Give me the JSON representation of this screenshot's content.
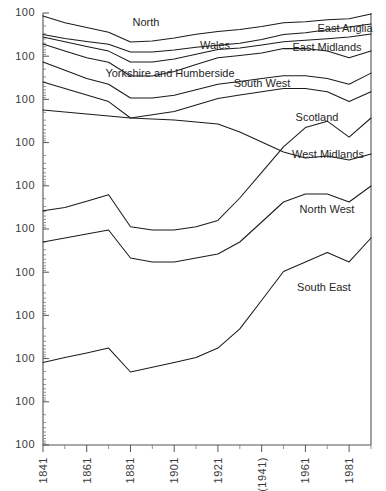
{
  "chart_data": {
    "type": "line",
    "title": "",
    "subtitle": "",
    "xlabel": "",
    "ylabel": "",
    "grid": false,
    "legend_position": "inline-labels",
    "note": "Ten UK standard regions, each drawn on its own vertically offset logarithmic index scale; every y-axis tick is labelled 100 (index base).",
    "x": [
      1841,
      1851,
      1861,
      1871,
      1881,
      1891,
      1901,
      1911,
      1921,
      1931,
      1941,
      1951,
      1961,
      1971,
      1981,
      1991
    ],
    "x_tick_labels": [
      "1841",
      "",
      "1861",
      "",
      "1881",
      "",
      "1901",
      "",
      "1921",
      "",
      "(1941)",
      "",
      "1961",
      "",
      "1981",
      ""
    ],
    "x_major_labels": [
      "1841",
      "1861",
      "1881",
      "1901",
      "1921",
      "(1941)",
      "1961",
      "1981"
    ],
    "xlim": [
      1841,
      1991
    ],
    "y_tick_labels": [
      "100",
      "100",
      "100",
      "100",
      "100",
      "100",
      "100",
      "100",
      "100",
      "100",
      "100"
    ],
    "y_axis_repeats": 11,
    "panel_count": 10,
    "series": [
      {
        "name": "North",
        "label": "North",
        "label_x": 1896,
        "label_px": [
          146,
          23
        ],
        "values": [
          64,
          57,
          52,
          47,
          37,
          38,
          41,
          45,
          48,
          50,
          53,
          57,
          58,
          60,
          61,
          66
        ]
      },
      {
        "name": "East Anglia",
        "label": "East Anglia",
        "label_x": 1976,
        "label_px": [
          345,
          29
        ],
        "values": [
          52,
          48,
          45,
          42,
          34,
          34,
          36,
          39,
          41,
          43,
          47,
          52,
          54,
          57,
          60,
          63
        ]
      },
      {
        "name": "Wales",
        "label": "Wales",
        "label_x": 1901,
        "label_px": [
          215,
          46
        ],
        "values": [
          46,
          43,
          40,
          37,
          30,
          30,
          32,
          35,
          38,
          39,
          41,
          43,
          44,
          45,
          46,
          48
        ]
      },
      {
        "name": "East Midlands",
        "label": "East Midlands",
        "label_x": 1961,
        "label_px": [
          327,
          48
        ],
        "values": [
          40,
          37,
          34,
          32,
          26,
          26,
          28,
          31,
          34,
          35,
          36,
          38,
          38,
          37,
          34,
          37
        ]
      },
      {
        "name": "Yorkshire and Humberside",
        "label": "Yorkshire and Humberside",
        "label_x": 1881,
        "label_px": [
          170,
          74
        ],
        "values": [
          33,
          30,
          27,
          25,
          20,
          20,
          21,
          23,
          25,
          26,
          27,
          28,
          28,
          27,
          25,
          29
        ]
      },
      {
        "name": "South West",
        "label": "South West",
        "label_x": 1926,
        "label_px": [
          262,
          84
        ],
        "values": [
          26,
          24,
          22,
          20,
          15,
          16,
          17,
          19,
          21,
          22,
          23,
          24,
          24,
          23,
          20,
          23
        ]
      },
      {
        "name": "Scotland",
        "label": "Scotland",
        "label_x": 1951,
        "label_px": [
          317,
          118
        ]
      },
      {
        "name": "West Midlands",
        "label": "West Midlands",
        "label_x": 1956,
        "label_px": [
          328,
          155
        ],
        "values": [
          18,
          19,
          21,
          23,
          13,
          12,
          12,
          13,
          15,
          22,
          30,
          38,
          44,
          46,
          41,
          47
        ]
      },
      {
        "name": "North West",
        "label": "North West",
        "label_x": 1956,
        "label_px": [
          327,
          210
        ],
        "values": [
          14,
          15,
          16,
          17,
          10,
          9,
          9,
          10,
          11,
          14,
          19,
          24,
          26,
          26,
          24,
          28
        ]
      },
      {
        "name": "South East",
        "label": "South East",
        "label_x": 1956,
        "label_px": [
          324,
          288
        ],
        "values": [
          5,
          6,
          7,
          8,
          3,
          4,
          5,
          6,
          8,
          12,
          18,
          24,
          26,
          28,
          26,
          31
        ]
      }
    ]
  },
  "chart": {
    "plot": {
      "left": 43,
      "top": 13,
      "right": 371,
      "bottom": 445
    },
    "axis_color": "#555555",
    "line_color": "#1b1b1b",
    "text_color": "#2b2b2b",
    "background": "#ffffff"
  }
}
